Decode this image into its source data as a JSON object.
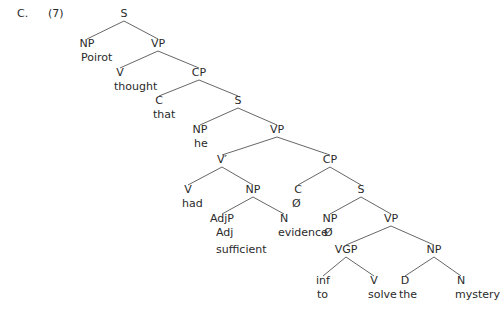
{
  "example": {
    "section_label": "C.",
    "number": "(7)"
  },
  "tree": {
    "nodes": [
      {
        "id": "S1",
        "cat": "S",
        "x": 124,
        "y": 8,
        "word": null
      },
      {
        "id": "NP1",
        "cat": "NP",
        "x": 87,
        "y": 38,
        "word": "Poirot"
      },
      {
        "id": "VP1",
        "cat": "VP",
        "x": 158,
        "y": 38,
        "word": null
      },
      {
        "id": "V1",
        "cat": "V",
        "x": 120,
        "y": 67,
        "word": "thought"
      },
      {
        "id": "CP1",
        "cat": "CP",
        "x": 199,
        "y": 67,
        "word": null
      },
      {
        "id": "C1",
        "cat": "C",
        "x": 159,
        "y": 95,
        "word": "that"
      },
      {
        "id": "S2",
        "cat": "S",
        "x": 238,
        "y": 95,
        "word": null
      },
      {
        "id": "NP2",
        "cat": "NP",
        "x": 200,
        "y": 124,
        "word": "he"
      },
      {
        "id": "VP2",
        "cat": "VP",
        "x": 277,
        "y": 124,
        "word": null
      },
      {
        "id": "Vbar",
        "cat": "V′",
        "x": 222,
        "y": 154,
        "word": null
      },
      {
        "id": "CP2",
        "cat": "CP",
        "x": 330,
        "y": 154,
        "word": null
      },
      {
        "id": "V2",
        "cat": "V",
        "x": 188,
        "y": 184,
        "word": "had"
      },
      {
        "id": "NP3",
        "cat": "NP",
        "x": 253,
        "y": 184,
        "word": null
      },
      {
        "id": "C2",
        "cat": "C",
        "x": 298,
        "y": 184,
        "word": "Ø"
      },
      {
        "id": "S3",
        "cat": "S",
        "x": 361,
        "y": 184,
        "word": null
      },
      {
        "id": "AdjP",
        "cat": "AdjP",
        "x": 222,
        "y": 213,
        "word": null
      },
      {
        "id": "N1",
        "cat": "N",
        "x": 284,
        "y": 213,
        "word": "evidence"
      },
      {
        "id": "NP4",
        "cat": "NP",
        "x": 330,
        "y": 213,
        "word": "Ø"
      },
      {
        "id": "VP3",
        "cat": "VP",
        "x": 391,
        "y": 213,
        "word": null
      },
      {
        "id": "VGP",
        "cat": "VGP",
        "x": 346,
        "y": 244,
        "word": null
      },
      {
        "id": "NP5",
        "cat": "NP",
        "x": 434,
        "y": 244,
        "word": null
      },
      {
        "id": "inf",
        "cat": "inf",
        "x": 323,
        "y": 275,
        "word": "to"
      },
      {
        "id": "V3",
        "cat": "V",
        "x": 374,
        "y": 275,
        "word": "solve"
      },
      {
        "id": "D1",
        "cat": "D",
        "x": 405,
        "y": 275,
        "word": "the"
      },
      {
        "id": "N2",
        "cat": "N",
        "x": 461,
        "y": 275,
        "word": "mystery"
      }
    ],
    "extra_labels": [
      {
        "parent": "AdjP",
        "text": "Adj",
        "x": 216,
        "y": 227
      },
      {
        "parent": "AdjP",
        "text": "sufficient",
        "x": 216,
        "y": 244
      }
    ],
    "edges": [
      [
        "S1",
        "NP1"
      ],
      [
        "S1",
        "VP1"
      ],
      [
        "VP1",
        "V1"
      ],
      [
        "VP1",
        "CP1"
      ],
      [
        "CP1",
        "C1"
      ],
      [
        "CP1",
        "S2"
      ],
      [
        "S2",
        "NP2"
      ],
      [
        "S2",
        "VP2"
      ],
      [
        "VP2",
        "Vbar"
      ],
      [
        "VP2",
        "CP2"
      ],
      [
        "Vbar",
        "V2"
      ],
      [
        "Vbar",
        "NP3"
      ],
      [
        "NP3",
        "AdjP"
      ],
      [
        "NP3",
        "N1"
      ],
      [
        "CP2",
        "C2"
      ],
      [
        "CP2",
        "S3"
      ],
      [
        "S3",
        "NP4"
      ],
      [
        "S3",
        "VP3"
      ],
      [
        "VP3",
        "VGP"
      ],
      [
        "VP3",
        "NP5"
      ],
      [
        "VGP",
        "inf"
      ],
      [
        "VGP",
        "V3"
      ],
      [
        "NP5",
        "D1"
      ],
      [
        "NP5",
        "N2"
      ]
    ]
  }
}
